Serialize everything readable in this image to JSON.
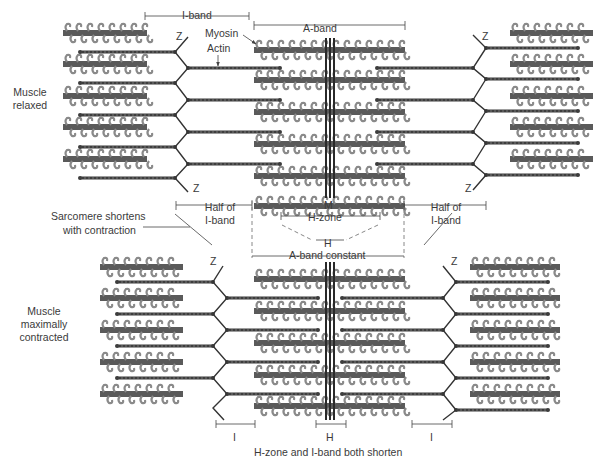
{
  "diagram": {
    "colors": {
      "myosin": "#5a5a5a",
      "myosin_head": "#8a8a8a",
      "actin": "#3d3d3d",
      "z_line": "#333333",
      "m_line": "#2a2a2a",
      "annotation": "#444444",
      "dashed": "#888888"
    },
    "top": {
      "state_label_line1": "Muscle",
      "state_label_line2": "relaxed",
      "i_band": "I-band",
      "a_band": "A-band",
      "myosin": "Myosin",
      "actin": "Actin",
      "z_top_left": "Z",
      "z_bottom_left": "Z",
      "z_top_right": "Z",
      "z_bottom_right": "Z",
      "m_line": "M"
    },
    "middle": {
      "half_i_left_1": "Half of",
      "half_i_left_2": "I-band",
      "half_i_right_1": "Half of",
      "half_i_right_2": "I-band",
      "sarcomere_1": "Sarcomere shortens",
      "sarcomere_2": "with contraction",
      "h_zone": "H-zone",
      "h": "H",
      "a_band_constant": "A-band constant"
    },
    "bottom": {
      "state_label_line1": "Muscle",
      "state_label_line2": "maximally",
      "state_label_line3": "contracted",
      "z_left": "Z",
      "z_right": "Z",
      "i_left": "I",
      "h": "H",
      "i_right": "I",
      "caption": "H-zone and I-band both shorten"
    }
  }
}
